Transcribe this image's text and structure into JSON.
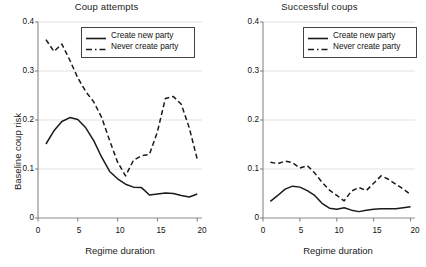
{
  "figure": {
    "width": 426,
    "height": 267,
    "background": "#ffffff",
    "line_color": "#1a1a1a",
    "grid_color": "#d9d9d9",
    "axis_color": "#6e6e6e"
  },
  "chart_data": [
    {
      "type": "line",
      "title": "Coup attempts",
      "xlabel": "Regime duration",
      "ylabel": "Baseline coup risk",
      "xlim": [
        0,
        20.6
      ],
      "ylim": [
        0,
        0.4
      ],
      "xticks": [
        0,
        5,
        10,
        15,
        20
      ],
      "xticklabels": [
        "0",
        "5",
        "10",
        "15",
        "20"
      ],
      "yticks": [
        0,
        0.1,
        0.2,
        0.3,
        0.4
      ],
      "yticklabels": [
        "0",
        "0.1",
        "0.2",
        "0.3",
        "0.4"
      ],
      "grid": "horizontal",
      "legend_position": "top-right",
      "x": [
        1,
        2,
        3,
        4,
        5,
        6,
        7,
        8,
        9,
        10,
        11,
        12,
        13,
        14,
        15,
        16,
        17,
        18,
        19,
        20
      ],
      "series": [
        {
          "name": "Create new party",
          "style": "solid",
          "values": [
            0.151,
            0.178,
            0.197,
            0.205,
            0.201,
            0.184,
            0.158,
            0.124,
            0.095,
            0.08,
            0.069,
            0.063,
            0.062,
            0.047,
            0.049,
            0.051,
            0.05,
            0.046,
            0.043,
            0.049,
            0.032
          ]
        },
        {
          "name": "Never create party",
          "style": "dashed",
          "values": [
            0.364,
            0.34,
            0.355,
            0.322,
            0.286,
            0.258,
            0.237,
            0.205,
            0.158,
            0.114,
            0.086,
            0.118,
            0.127,
            0.13,
            0.176,
            0.244,
            0.248,
            0.232,
            0.184,
            0.12,
            0.056
          ]
        }
      ]
    },
    {
      "type": "line",
      "title": "Successful coups",
      "xlabel": "Regime duration",
      "ylabel": "Baseline coup risk",
      "xlim": [
        0,
        20.6
      ],
      "ylim": [
        0,
        0.4
      ],
      "xticks": [
        0,
        5,
        10,
        15,
        20
      ],
      "xticklabels": [
        "0",
        "5",
        "10",
        "15",
        "20"
      ],
      "yticks": [
        0,
        0.1,
        0.2,
        0.3,
        0.4
      ],
      "yticklabels": [
        "0",
        "0.1",
        "0.2",
        "0.3",
        "0.4"
      ],
      "grid": "horizontal",
      "legend_position": "top-right",
      "x": [
        1,
        2,
        3,
        4,
        5,
        6,
        7,
        8,
        9,
        10,
        11,
        12,
        13,
        14,
        15,
        16,
        17,
        18,
        19,
        20
      ],
      "series": [
        {
          "name": "Create new party",
          "style": "solid",
          "values": [
            0.034,
            0.046,
            0.059,
            0.065,
            0.063,
            0.056,
            0.046,
            0.03,
            0.02,
            0.018,
            0.021,
            0.016,
            0.013,
            0.016,
            0.018,
            0.019,
            0.019,
            0.019,
            0.021,
            0.023,
            0.016
          ]
        },
        {
          "name": "Never create party",
          "style": "dashed",
          "values": [
            0.114,
            0.111,
            0.116,
            0.113,
            0.102,
            0.107,
            0.092,
            0.073,
            0.057,
            0.046,
            0.035,
            0.055,
            0.062,
            0.056,
            0.071,
            0.086,
            0.079,
            0.069,
            0.059,
            0.048,
            0.023
          ]
        }
      ]
    }
  ],
  "legend": {
    "entries": [
      {
        "label": "Create new party",
        "style": "solid"
      },
      {
        "label": "Never create party",
        "style": "dashed"
      }
    ]
  }
}
